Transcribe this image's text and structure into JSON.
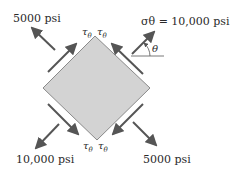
{
  "labels": {
    "top_left": "5000 psi",
    "top_right": "σθ = 10,000 psi",
    "bottom_left": "10,000 psi",
    "bottom_right": "5000 psi",
    "angle": "θ",
    "tau": "τ",
    "tau_sub": "θ"
  },
  "colors": {
    "element_fill": "#d3d3d3",
    "element_stroke": "#8a8a8a",
    "arrow": "#555555"
  }
}
